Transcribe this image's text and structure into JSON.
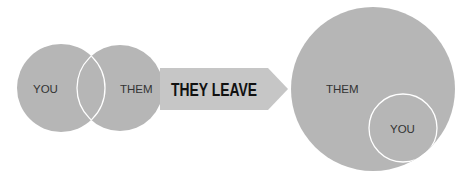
{
  "colors": {
    "circle_fill": "#b6b6b6",
    "arrow_fill": "#c6c6c6",
    "outline": "#ffffff",
    "label": "#333333",
    "arrow_text": "#111111"
  },
  "before": {
    "left_circle_label": "YOU",
    "right_circle_label": "THEM"
  },
  "arrow": {
    "label": "THEY LEAVE"
  },
  "after": {
    "big_circle_label": "THEM",
    "small_circle_label": "YOU"
  }
}
